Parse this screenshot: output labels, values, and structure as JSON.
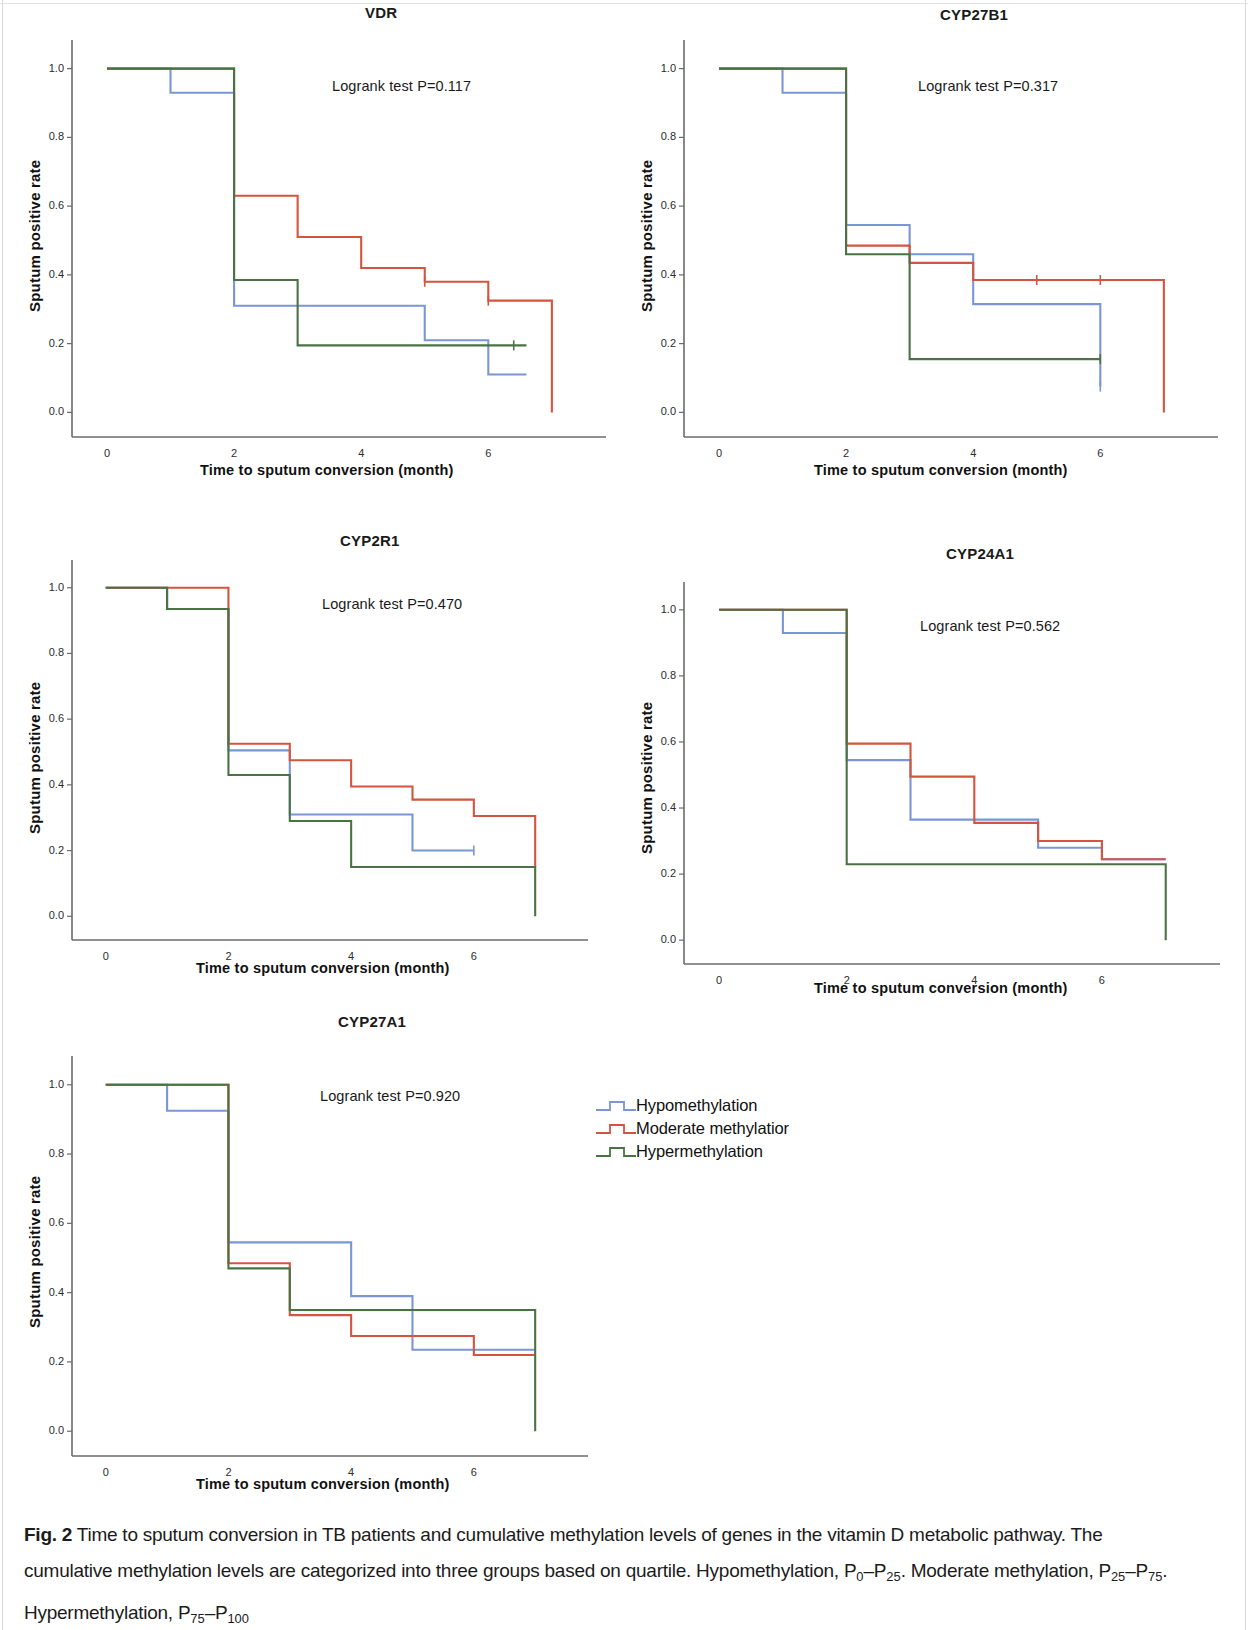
{
  "figure": {
    "label": "Fig. 2",
    "caption_lines": [
      "Time to sputum conversion in TB patients and cumulative methylation levels of genes in the vitamin D metabolic pathway. The",
      "cumulative methylation levels are categorized into three groups based on quartile. Hypomethylation, P0–P25. Moderate methylation, P25–P75.",
      "Hypermethylation, P75–P100"
    ],
    "caption_full": "Fig. 2 Time to sputum conversion in TB patients and cumulative methylation levels of genes in the vitamin D metabolic pathway. The cumulative methylation levels are categorized into three groups based on quartile. Hypomethylation, P0–P25. Moderate methylation, P25–P75. Hypermethylation, P75–P100"
  },
  "axes_common": {
    "xlabel": "Time to sputum conversion (month)",
    "ylabel": "Sputum positive rate",
    "xticks": [
      "0",
      "2",
      "4",
      "6"
    ],
    "xtick_values": [
      0,
      2,
      4,
      6
    ],
    "yticks": [
      "0.0",
      "0.2",
      "0.4",
      "0.6",
      "0.8",
      "1.0"
    ],
    "ytick_values": [
      0.0,
      0.2,
      0.4,
      0.6,
      0.8,
      1.0
    ],
    "xlim": [
      -0.55,
      7.6
    ],
    "ylim": [
      -0.06,
      1.06
    ],
    "grid": false
  },
  "legend": {
    "position": "center-right",
    "items": [
      {
        "label": "Hypomethylation",
        "color": "#7b96d4",
        "key": "hypo"
      },
      {
        "label": "Moderate methylatior",
        "color": "#d4553f",
        "key": "moderate"
      },
      {
        "label": "Hypermethylation",
        "color": "#4a7344",
        "key": "hyper"
      }
    ]
  },
  "colors": {
    "hypomethylation": "#7b96d4",
    "moderate_methylation": "#d4553f",
    "hypermethylation": "#4a7344",
    "axis": "#6b6b6b",
    "text": "#1a1a1a"
  },
  "chart_data": [
    {
      "type": "line",
      "subtype": "kaplan-meier-step",
      "title": "VDR",
      "annotation": "Logrank test P=0.117",
      "pvalue": 0.117,
      "xlabel": "Time to sputum conversion (month)",
      "ylabel": "Sputum positive rate",
      "xlim": [
        -0.55,
        7.6
      ],
      "ylim": [
        -0.06,
        1.06
      ],
      "xticks": [
        0,
        2,
        4,
        6
      ],
      "yticks": [
        0.0,
        0.2,
        0.4,
        0.6,
        0.8,
        1.0
      ],
      "grid": false,
      "series": [
        {
          "name": "Hypomethylation",
          "color": "#7b96d4",
          "x": [
            0,
            1,
            2,
            3,
            5,
            6
          ],
          "y": [
            1.0,
            0.93,
            0.31,
            0.31,
            0.21,
            0.11
          ],
          "end_x": 6.6,
          "censor": []
        },
        {
          "name": "Moderate methylation",
          "color": "#d4553f",
          "x": [
            0,
            2,
            3,
            4,
            5,
            6
          ],
          "y": [
            1.0,
            0.63,
            0.51,
            0.42,
            0.38,
            0.325
          ],
          "end_x": 7.0,
          "drop_to_zero": true,
          "censor": [
            [
              5.0,
              0.38
            ],
            [
              6.0,
              0.325
            ]
          ]
        },
        {
          "name": "Hypermethylation",
          "color": "#4a7344",
          "x": [
            0,
            2,
            3
          ],
          "y": [
            1.0,
            0.385,
            0.195
          ],
          "end_x": 6.6,
          "censor": [
            [
              6.4,
              0.195
            ]
          ]
        }
      ]
    },
    {
      "type": "line",
      "subtype": "kaplan-meier-step",
      "title": "CYP27B1",
      "annotation": "Logrank test P=0.317",
      "pvalue": 0.317,
      "xlabel": "Time to sputum conversion (month)",
      "ylabel": "Sputum positive rate",
      "xlim": [
        -0.55,
        7.6
      ],
      "ylim": [
        -0.06,
        1.06
      ],
      "xticks": [
        0,
        2,
        4,
        6
      ],
      "yticks": [
        0.0,
        0.2,
        0.4,
        0.6,
        0.8,
        1.0
      ],
      "grid": false,
      "series": [
        {
          "name": "Hypomethylation",
          "color": "#7b96d4",
          "x": [
            0,
            1,
            2,
            3,
            4
          ],
          "y": [
            1.0,
            0.93,
            0.545,
            0.46,
            0.315
          ],
          "end_x": 6.0,
          "drop_to": 0.075,
          "censor": [
            [
              6.0,
              0.075
            ]
          ]
        },
        {
          "name": "Moderate methylation",
          "color": "#d4553f",
          "x": [
            0,
            2,
            3,
            4
          ],
          "y": [
            1.0,
            0.485,
            0.435,
            0.385
          ],
          "end_x": 7.0,
          "drop_to_zero": true,
          "censor": [
            [
              5.0,
              0.385
            ],
            [
              6.0,
              0.385
            ]
          ]
        },
        {
          "name": "Hypermethylation",
          "color": "#4a7344",
          "x": [
            0,
            2,
            3
          ],
          "y": [
            1.0,
            0.46,
            0.155
          ],
          "end_x": 6.0,
          "censor": [
            [
              6.0,
              0.155
            ]
          ]
        }
      ]
    },
    {
      "type": "line",
      "subtype": "kaplan-meier-step",
      "title": "CYP2R1",
      "annotation": "Logrank test P=0.470",
      "pvalue": 0.47,
      "xlabel": "Time to sputum conversion (month)",
      "ylabel": "Sputum positive rate",
      "xlim": [
        -0.55,
        7.6
      ],
      "ylim": [
        -0.06,
        1.06
      ],
      "xticks": [
        0,
        2,
        4,
        6
      ],
      "yticks": [
        0.0,
        0.2,
        0.4,
        0.6,
        0.8,
        1.0
      ],
      "grid": false,
      "series": [
        {
          "name": "Hypomethylation",
          "color": "#7b96d4",
          "x": [
            0,
            1,
            2,
            3,
            5
          ],
          "y": [
            1.0,
            0.935,
            0.505,
            0.31,
            0.2
          ],
          "end_x": 6.0,
          "censor": [
            [
              6.0,
              0.2
            ]
          ]
        },
        {
          "name": "Moderate methylation",
          "color": "#d4553f",
          "x": [
            0,
            2,
            3,
            4,
            5,
            6
          ],
          "y": [
            1.0,
            0.525,
            0.475,
            0.395,
            0.355,
            0.305
          ],
          "end_x": 7.0,
          "drop_to": 0.15,
          "censor": []
        },
        {
          "name": "Hypermethylation",
          "color": "#4a7344",
          "x": [
            0,
            1,
            2,
            3,
            4
          ],
          "y": [
            1.0,
            0.935,
            0.43,
            0.29,
            0.15
          ],
          "end_x": 7.0,
          "drop_to_zero": true,
          "censor": []
        }
      ]
    },
    {
      "type": "line",
      "subtype": "kaplan-meier-step",
      "title": "CYP24A1",
      "annotation": "Logrank test P=0.562",
      "pvalue": 0.562,
      "xlabel": "Time to sputum conversion (month)",
      "ylabel": "Sputum positive rate",
      "xlim": [
        -0.55,
        7.6
      ],
      "ylim": [
        -0.06,
        1.06
      ],
      "xticks": [
        0,
        2,
        4,
        6
      ],
      "yticks": [
        0.0,
        0.2,
        0.4,
        0.6,
        0.8,
        1.0
      ],
      "grid": false,
      "series": [
        {
          "name": "Hypomethylation",
          "color": "#7b96d4",
          "x": [
            0,
            1,
            2,
            3,
            5,
            6
          ],
          "y": [
            1.0,
            0.93,
            0.545,
            0.365,
            0.28,
            0.245
          ],
          "end_x": 7.0,
          "censor": []
        },
        {
          "name": "Moderate methylation",
          "color": "#d4553f",
          "x": [
            0,
            2,
            3,
            4,
            5,
            6
          ],
          "y": [
            1.0,
            0.595,
            0.495,
            0.355,
            0.3,
            0.245
          ],
          "end_x": 7.0,
          "censor": []
        },
        {
          "name": "Hypermethylation",
          "color": "#4a7344",
          "x": [
            0,
            2
          ],
          "y": [
            1.0,
            0.23
          ],
          "end_x": 7.0,
          "drop_to_zero": true,
          "censor": []
        }
      ]
    },
    {
      "type": "line",
      "subtype": "kaplan-meier-step",
      "title": "CYP27A1",
      "annotation": "Logrank test P=0.920",
      "pvalue": 0.92,
      "xlabel": "Time to sputum conversion (month)",
      "ylabel": "Sputum positive rate",
      "xlim": [
        -0.55,
        7.6
      ],
      "ylim": [
        -0.06,
        1.06
      ],
      "xticks": [
        0,
        2,
        4,
        6
      ],
      "yticks": [
        0.0,
        0.2,
        0.4,
        0.6,
        0.8,
        1.0
      ],
      "grid": false,
      "series": [
        {
          "name": "Hypomethylation",
          "color": "#7b96d4",
          "x": [
            0,
            1,
            2,
            4,
            5
          ],
          "y": [
            1.0,
            0.925,
            0.545,
            0.39,
            0.235
          ],
          "end_x": 7.0,
          "censor": []
        },
        {
          "name": "Moderate methylation",
          "color": "#d4553f",
          "x": [
            0,
            2,
            3,
            4,
            6
          ],
          "y": [
            1.0,
            0.485,
            0.335,
            0.275,
            0.22
          ],
          "end_x": 7.0,
          "censor": []
        },
        {
          "name": "Hypermethylation",
          "color": "#4a7344",
          "x": [
            0,
            2,
            3
          ],
          "y": [
            1.0,
            0.47,
            0.35
          ],
          "end_x": 7.0,
          "drop_to_zero": true,
          "censor": []
        }
      ]
    }
  ],
  "panels": [
    {
      "key": "vdr",
      "title": "VDR",
      "annotation": "Logrank test P=0.117"
    },
    {
      "key": "cyp27b1",
      "title": "CYP27B1",
      "annotation": "Logrank test P=0.317"
    },
    {
      "key": "cyp2r1",
      "title": "CYP2R1",
      "annotation": "Logrank test P=0.470"
    },
    {
      "key": "cyp24a1",
      "title": "CYP24A1",
      "annotation": "Logrank test P=0.562"
    },
    {
      "key": "cyp27a1",
      "title": "CYP27A1",
      "annotation": "Logrank test P=0.920"
    }
  ]
}
